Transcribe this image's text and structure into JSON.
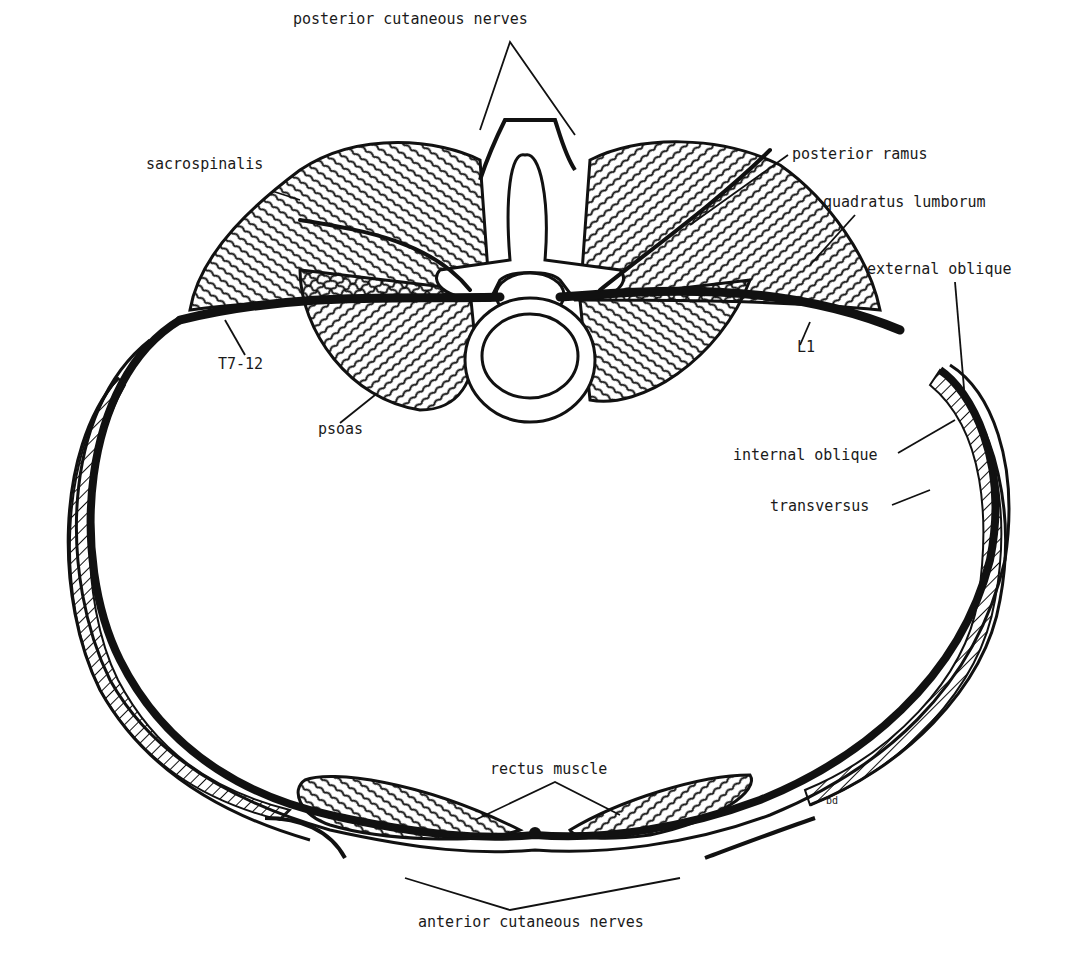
{
  "figure": {
    "colors": {
      "ink": "#111111",
      "paper": "#ffffff"
    }
  },
  "labels": {
    "posterior_cutaneous_nerves": "posterior cutaneous nerves",
    "sacrospinalis": "sacrospinalis",
    "posterior_ramus": "posterior ramus",
    "quadratus_lumborum": "quadratus lumborum",
    "external_oblique": "external oblique",
    "t7_12": "T7-12",
    "l1": "L1",
    "psoas": "psoas",
    "internal_oblique": "internal oblique",
    "transversus": "transversus",
    "rectus_muscle": "rectus muscle",
    "anterior_cutaneous_nerves": "anterior cutaneous nerves",
    "artist_mark": "bd"
  }
}
